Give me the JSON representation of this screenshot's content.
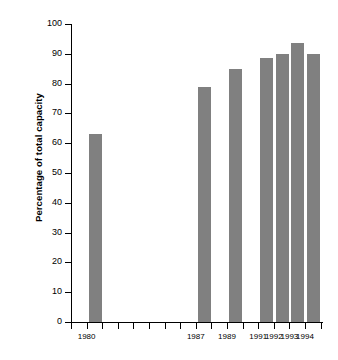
{
  "chart_data": {
    "type": "bar",
    "title": "",
    "xlabel": "",
    "ylabel": "Percentage of total capacity",
    "ylim": [
      0,
      100
    ],
    "ytick_step": 10,
    "grid": false,
    "legend": null,
    "bar_color": "#808080",
    "axis_color": "#000000",
    "background_color": "#ffffff",
    "categories": [
      "1980",
      "1987",
      "1989",
      "1991",
      "1992",
      "1993",
      "1994"
    ],
    "values": [
      63,
      79,
      85,
      88.5,
      90,
      93.5,
      90
    ],
    "y_ticks": [
      "0",
      "10",
      "20",
      "30",
      "40",
      "50",
      "60",
      "70",
      "80",
      "90",
      "100"
    ],
    "x_axis_all_ticks": [
      "1979",
      "1980",
      "1981",
      "1982",
      "1983",
      "1984",
      "1985",
      "1986",
      "1987",
      "1988",
      "1989",
      "1990",
      "1991",
      "1992",
      "1993",
      "1994",
      "1995"
    ],
    "x_labeled_ticks": [
      "1980",
      "1987",
      "1989",
      "1991",
      "1992",
      "1993",
      "1994"
    ],
    "bars": [
      {
        "category": "1980",
        "value": 63
      },
      {
        "category": "1987",
        "value": 79
      },
      {
        "category": "1989",
        "value": 85
      },
      {
        "category": "1991",
        "value": 88.5
      },
      {
        "category": "1992",
        "value": 90
      },
      {
        "category": "1993",
        "value": 93.5
      },
      {
        "category": "1994",
        "value": 90
      }
    ]
  }
}
